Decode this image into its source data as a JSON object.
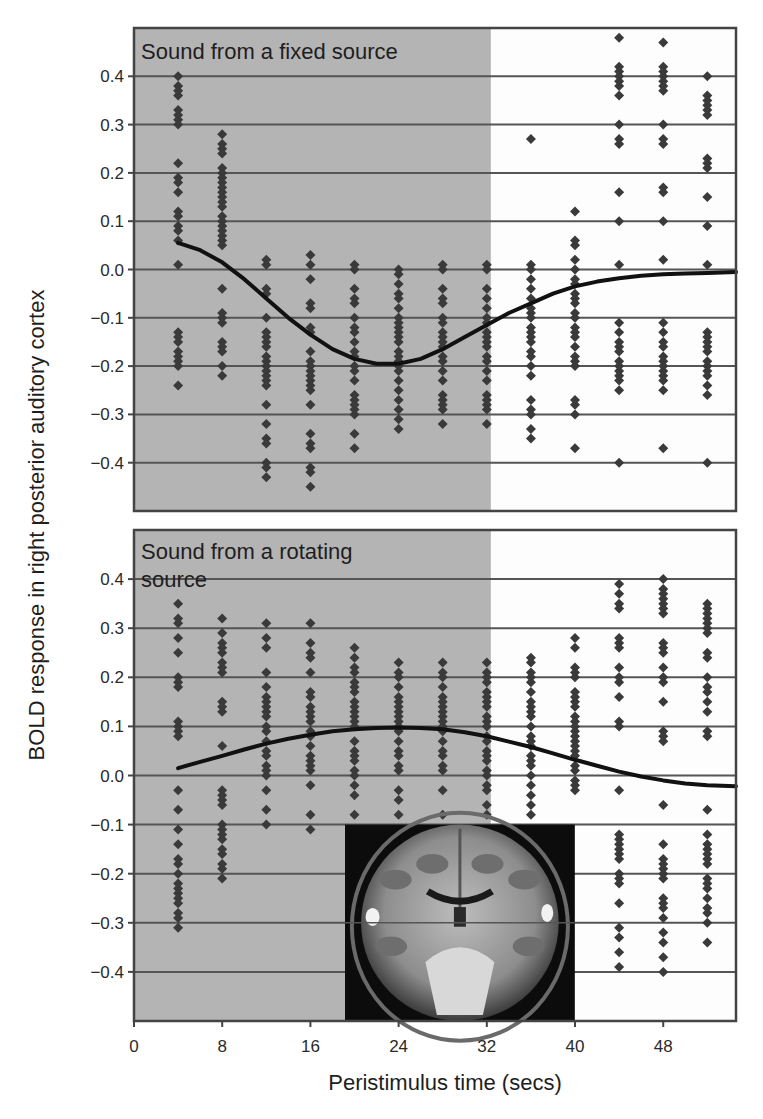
{
  "chart_data": [
    {
      "type": "scatter",
      "panel": "top",
      "title": "Sound from a fixed source",
      "xlabel": "Peristimulus time (secs)",
      "ylabel": "BOLD response in right posterior auditory cortex",
      "xlim": [
        0,
        54.6
      ],
      "ylim": [
        -0.5,
        0.5
      ],
      "xticks": [
        0,
        8,
        16,
        24,
        32,
        40,
        48
      ],
      "yticks": [
        0.4,
        0.3,
        0.2,
        0.1,
        0.0,
        -0.1,
        -0.2,
        -0.3,
        -0.4
      ],
      "ytick_labels": [
        "0.4",
        "0.3",
        "0.2",
        "0.1",
        "0.0",
        "−0.1",
        "−0.2",
        "−0.3",
        "−0.4"
      ],
      "grid": "horizontal",
      "shaded_region": {
        "x0": 0,
        "x1": 32,
        "color": "#b4b4b4"
      },
      "points": [
        {
          "x": 4,
          "y": [
            0.4,
            0.38,
            0.37,
            0.36,
            0.33,
            0.32,
            0.31,
            0.3,
            0.22,
            0.19,
            0.18,
            0.16,
            0.12,
            0.11,
            0.09,
            0.08,
            0.06,
            0.01,
            -0.13,
            -0.14,
            -0.15,
            -0.17,
            -0.18,
            -0.19,
            -0.2,
            -0.24
          ]
        },
        {
          "x": 8,
          "y": [
            0.28,
            0.26,
            0.25,
            0.24,
            0.21,
            0.2,
            0.19,
            0.18,
            0.17,
            0.16,
            0.15,
            0.14,
            0.13,
            0.11,
            0.1,
            0.09,
            0.08,
            0.07,
            0.06,
            0.05,
            -0.04,
            -0.09,
            -0.1,
            -0.11,
            -0.15,
            -0.16,
            -0.17,
            -0.2,
            -0.22
          ]
        },
        {
          "x": 12,
          "y": [
            0.02,
            0.01,
            -0.04,
            -0.05,
            -0.1,
            -0.13,
            -0.14,
            -0.15,
            -0.16,
            -0.18,
            -0.19,
            -0.2,
            -0.21,
            -0.22,
            -0.23,
            -0.24,
            -0.28,
            -0.32,
            -0.35,
            -0.36,
            -0.4,
            -0.41,
            -0.43
          ]
        },
        {
          "x": 16,
          "y": [
            0.03,
            0.01,
            -0.02,
            -0.07,
            -0.08,
            -0.12,
            -0.13,
            -0.17,
            -0.19,
            -0.2,
            -0.21,
            -0.22,
            -0.23,
            -0.24,
            -0.25,
            -0.28,
            -0.34,
            -0.36,
            -0.37,
            -0.41,
            -0.42,
            -0.45
          ]
        },
        {
          "x": 20,
          "y": [
            0.01,
            0.0,
            -0.04,
            -0.06,
            -0.07,
            -0.1,
            -0.12,
            -0.13,
            -0.15,
            -0.17,
            -0.18,
            -0.2,
            -0.21,
            -0.23,
            -0.26,
            -0.27,
            -0.28,
            -0.29,
            -0.3,
            -0.34,
            -0.37
          ]
        },
        {
          "x": 24,
          "y": [
            0.0,
            -0.01,
            -0.03,
            -0.05,
            -0.06,
            -0.08,
            -0.1,
            -0.11,
            -0.12,
            -0.13,
            -0.14,
            -0.15,
            -0.17,
            -0.18,
            -0.19,
            -0.2,
            -0.21,
            -0.23,
            -0.25,
            -0.27,
            -0.29,
            -0.31,
            -0.33
          ]
        },
        {
          "x": 28,
          "y": [
            0.01,
            0.0,
            -0.04,
            -0.06,
            -0.07,
            -0.1,
            -0.11,
            -0.13,
            -0.14,
            -0.15,
            -0.16,
            -0.18,
            -0.19,
            -0.21,
            -0.23,
            -0.26,
            -0.27,
            -0.28,
            -0.29,
            -0.32
          ]
        },
        {
          "x": 32,
          "y": [
            0.01,
            0.0,
            -0.04,
            -0.06,
            -0.08,
            -0.1,
            -0.11,
            -0.13,
            -0.14,
            -0.15,
            -0.16,
            -0.18,
            -0.19,
            -0.21,
            -0.23,
            -0.26,
            -0.27,
            -0.28,
            -0.29,
            -0.32
          ]
        },
        {
          "x": 36,
          "y": [
            0.27,
            0.01,
            0.0,
            -0.02,
            -0.04,
            -0.06,
            -0.08,
            -0.09,
            -0.1,
            -0.12,
            -0.13,
            -0.14,
            -0.15,
            -0.17,
            -0.18,
            -0.2,
            -0.22,
            -0.27,
            -0.29,
            -0.3,
            -0.33,
            -0.35
          ]
        },
        {
          "x": 40,
          "y": [
            0.12,
            0.06,
            0.05,
            0.02,
            0.0,
            -0.02,
            -0.03,
            -0.05,
            -0.06,
            -0.07,
            -0.09,
            -0.1,
            -0.12,
            -0.13,
            -0.14,
            -0.16,
            -0.18,
            -0.19,
            -0.2,
            -0.27,
            -0.28,
            -0.3,
            -0.37
          ]
        },
        {
          "x": 44,
          "y": [
            0.48,
            0.42,
            0.41,
            0.4,
            0.39,
            0.38,
            0.36,
            0.3,
            0.27,
            0.26,
            0.16,
            0.1,
            0.01,
            -0.11,
            -0.13,
            -0.15,
            -0.16,
            -0.17,
            -0.19,
            -0.2,
            -0.21,
            -0.22,
            -0.23,
            -0.25,
            -0.4
          ]
        },
        {
          "x": 48,
          "y": [
            0.47,
            0.42,
            0.41,
            0.4,
            0.39,
            0.38,
            0.37,
            0.3,
            0.27,
            0.26,
            0.17,
            0.16,
            0.1,
            0.02,
            -0.11,
            -0.13,
            -0.15,
            -0.16,
            -0.18,
            -0.19,
            -0.2,
            -0.21,
            -0.22,
            -0.23,
            -0.25,
            -0.37
          ]
        },
        {
          "x": 52,
          "y": [
            0.4,
            0.36,
            0.35,
            0.34,
            0.33,
            0.32,
            0.23,
            0.22,
            0.21,
            0.15,
            0.09,
            0.01,
            -0.13,
            -0.14,
            -0.15,
            -0.16,
            -0.17,
            -0.19,
            -0.2,
            -0.21,
            -0.22,
            -0.24,
            -0.26,
            -0.4
          ]
        }
      ],
      "fit_curve": {
        "x": [
          4,
          6,
          8,
          10,
          12,
          14,
          16,
          18,
          20,
          22,
          24,
          26,
          28,
          30,
          32,
          34,
          36,
          38,
          40,
          42,
          44,
          46,
          48,
          50,
          52,
          54.6
        ],
        "y": [
          0.055,
          0.04,
          0.015,
          -0.02,
          -0.06,
          -0.1,
          -0.135,
          -0.165,
          -0.185,
          -0.195,
          -0.195,
          -0.185,
          -0.165,
          -0.14,
          -0.115,
          -0.09,
          -0.07,
          -0.05,
          -0.035,
          -0.025,
          -0.018,
          -0.013,
          -0.01,
          -0.008,
          -0.007,
          -0.005
        ]
      }
    },
    {
      "type": "scatter",
      "panel": "bottom",
      "title": "Sound from a rotating source",
      "title_lines": [
        "Sound from a rotating",
        "source"
      ],
      "xlabel": "Peristimulus time (secs)",
      "ylabel": "BOLD response in right posterior auditory cortex",
      "xlim": [
        0,
        54.6
      ],
      "ylim": [
        -0.5,
        0.5
      ],
      "xticks": [
        0,
        8,
        16,
        24,
        32,
        40,
        48
      ],
      "yticks": [
        0.4,
        0.3,
        0.2,
        0.1,
        0.0,
        -0.1,
        -0.2,
        -0.3,
        -0.4
      ],
      "ytick_labels": [
        "0.4",
        "0.3",
        "0.2",
        "0.1",
        "0.0",
        "−0.1",
        "−0.2",
        "−0.3",
        "−0.4"
      ],
      "grid": "horizontal",
      "shaded_region": {
        "x0": 0,
        "x1": 32,
        "color": "#b4b4b4"
      },
      "inset_image": {
        "label": "coronal-brain-mri-slice",
        "x0": 19.5,
        "x1": 39.8,
        "y0": -0.1,
        "y1": -0.5
      },
      "points": [
        {
          "x": 4,
          "y": [
            0.35,
            0.32,
            0.31,
            0.28,
            0.25,
            0.2,
            0.19,
            0.18,
            0.11,
            0.1,
            0.09,
            0.08,
            -0.03,
            -0.07,
            -0.11,
            -0.14,
            -0.17,
            -0.18,
            -0.2,
            -0.22,
            -0.23,
            -0.24,
            -0.25,
            -0.26,
            -0.28,
            -0.29,
            -0.31
          ]
        },
        {
          "x": 8,
          "y": [
            0.32,
            0.29,
            0.27,
            0.26,
            0.25,
            0.23,
            0.22,
            0.21,
            0.15,
            0.14,
            0.13,
            0.06,
            -0.03,
            -0.04,
            -0.05,
            -0.06,
            -0.1,
            -0.11,
            -0.12,
            -0.13,
            -0.15,
            -0.16,
            -0.18,
            -0.19,
            -0.21
          ]
        },
        {
          "x": 12,
          "y": [
            0.31,
            0.28,
            0.26,
            0.21,
            0.18,
            0.16,
            0.15,
            0.14,
            0.13,
            0.12,
            0.1,
            0.09,
            0.07,
            0.05,
            0.04,
            0.02,
            0.01,
            0.0,
            -0.03,
            -0.07,
            -0.1
          ]
        },
        {
          "x": 16,
          "y": [
            0.31,
            0.27,
            0.25,
            0.24,
            0.21,
            0.17,
            0.16,
            0.14,
            0.13,
            0.12,
            0.11,
            0.09,
            0.08,
            0.06,
            0.04,
            0.03,
            0.02,
            0.01,
            -0.02,
            -0.08,
            -0.11
          ]
        },
        {
          "x": 20,
          "y": [
            0.26,
            0.24,
            0.22,
            0.21,
            0.19,
            0.18,
            0.17,
            0.15,
            0.14,
            0.13,
            0.12,
            0.11,
            0.1,
            0.07,
            0.05,
            0.04,
            0.03,
            0.01,
            0.0,
            -0.02,
            -0.04,
            -0.08
          ]
        },
        {
          "x": 24,
          "y": [
            0.23,
            0.21,
            0.2,
            0.18,
            0.16,
            0.15,
            0.14,
            0.13,
            0.12,
            0.11,
            0.1,
            0.09,
            0.07,
            0.05,
            0.04,
            0.02,
            0.01,
            -0.03,
            -0.05,
            -0.08
          ]
        },
        {
          "x": 28,
          "y": [
            0.23,
            0.21,
            0.2,
            0.18,
            0.16,
            0.15,
            0.14,
            0.13,
            0.12,
            0.11,
            0.1,
            0.09,
            0.07,
            0.05,
            0.04,
            0.02,
            0.01,
            -0.03,
            -0.08
          ]
        },
        {
          "x": 32,
          "y": [
            0.23,
            0.21,
            0.2,
            0.19,
            0.17,
            0.16,
            0.15,
            0.14,
            0.12,
            0.11,
            0.1,
            0.08,
            0.07,
            0.05,
            0.04,
            0.03,
            0.01,
            0.0,
            -0.02,
            -0.03,
            -0.06,
            -0.08
          ]
        },
        {
          "x": 36,
          "y": [
            0.24,
            0.23,
            0.21,
            0.2,
            0.19,
            0.17,
            0.15,
            0.14,
            0.13,
            0.12,
            0.1,
            0.08,
            0.07,
            0.06,
            0.04,
            0.03,
            0.02,
            0.0,
            -0.02,
            -0.04,
            -0.06,
            -0.08
          ]
        },
        {
          "x": 40,
          "y": [
            0.28,
            0.26,
            0.22,
            0.21,
            0.2,
            0.17,
            0.16,
            0.15,
            0.14,
            0.12,
            0.11,
            0.1,
            0.09,
            0.08,
            0.07,
            0.06,
            0.05,
            0.04,
            0.02,
            0.01,
            -0.01,
            -0.02,
            -0.03
          ]
        },
        {
          "x": 44,
          "y": [
            0.39,
            0.37,
            0.35,
            0.34,
            0.28,
            0.27,
            0.26,
            0.22,
            0.2,
            0.19,
            0.16,
            0.11,
            0.1,
            -0.03,
            -0.12,
            -0.13,
            -0.14,
            -0.15,
            -0.16,
            -0.17,
            -0.2,
            -0.21,
            -0.22,
            -0.26,
            -0.31,
            -0.33,
            -0.36,
            -0.39
          ]
        },
        {
          "x": 48,
          "y": [
            0.4,
            0.38,
            0.37,
            0.36,
            0.35,
            0.34,
            0.33,
            0.27,
            0.26,
            0.25,
            0.22,
            0.2,
            0.19,
            0.15,
            0.09,
            0.08,
            0.07,
            -0.06,
            -0.14,
            -0.17,
            -0.18,
            -0.19,
            -0.2,
            -0.21,
            -0.25,
            -0.26,
            -0.27,
            -0.29,
            -0.32,
            -0.34,
            -0.37,
            -0.4
          ]
        },
        {
          "x": 52,
          "y": [
            0.35,
            0.34,
            0.33,
            0.32,
            0.31,
            0.3,
            0.29,
            0.25,
            0.24,
            0.2,
            0.18,
            0.17,
            0.15,
            0.13,
            0.09,
            0.08,
            -0.07,
            -0.12,
            -0.14,
            -0.15,
            -0.16,
            -0.17,
            -0.18,
            -0.21,
            -0.22,
            -0.23,
            -0.25,
            -0.27,
            -0.28,
            -0.3,
            -0.34
          ]
        }
      ],
      "fit_curve": {
        "x": [
          4,
          6,
          8,
          10,
          12,
          14,
          16,
          18,
          20,
          22,
          24,
          26,
          28,
          30,
          32,
          34,
          36,
          38,
          40,
          42,
          44,
          46,
          48,
          50,
          52,
          54.6
        ],
        "y": [
          0.015,
          0.028,
          0.04,
          0.053,
          0.065,
          0.075,
          0.083,
          0.09,
          0.094,
          0.097,
          0.098,
          0.097,
          0.094,
          0.088,
          0.08,
          0.069,
          0.058,
          0.045,
          0.032,
          0.02,
          0.008,
          -0.002,
          -0.01,
          -0.016,
          -0.02,
          -0.022
        ]
      }
    }
  ],
  "figure": {
    "ylabel": "BOLD response in right posterior auditory cortex",
    "xlabel": "Peristimulus time (secs)",
    "panels": {
      "top": {
        "title": "Sound from a fixed source"
      },
      "bottom": {
        "title_line1": "Sound from a rotating",
        "title_line2": "source"
      }
    },
    "xtick_labels": [
      "0",
      "8",
      "16",
      "24",
      "32",
      "40",
      "48"
    ],
    "ytick_labels": [
      "0.4",
      "0.3",
      "0.2",
      "0.1",
      "0.0",
      "−0.1",
      "−0.2",
      "−0.3",
      "−0.4"
    ],
    "colors": {
      "shade": "#b4b4b4",
      "background": "#fdfdfd",
      "marker": "#3a3a3a",
      "curve": "#111111",
      "gridline": "#555555",
      "axis": "#444444"
    }
  }
}
